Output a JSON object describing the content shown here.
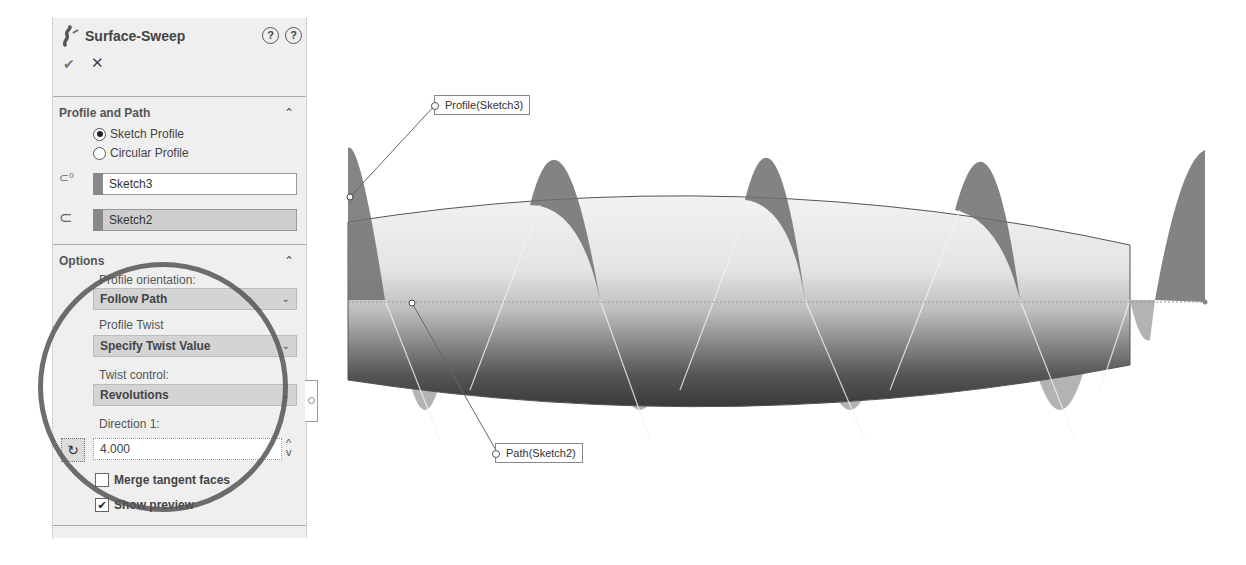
{
  "panel": {
    "title": "Surface-Sweep",
    "icons": {
      "feature": "sweep-feature-icon",
      "help_detail": "?",
      "help": "?",
      "ok": "✔",
      "cancel": "✕"
    },
    "profile_and_path": {
      "title": "Profile and Path",
      "collapse": "⌃",
      "radios": [
        {
          "label": "Sketch Profile",
          "checked": true
        },
        {
          "label": "Circular Profile",
          "checked": false
        }
      ],
      "profile_selection": "Sketch3",
      "path_selection": "Sketch2"
    },
    "options": {
      "title": "Options",
      "collapse": "⌃",
      "profile_orientation_label": "Profile orientation:",
      "profile_orientation_value": "Follow Path",
      "profile_twist_label": "Profile Twist",
      "profile_twist_value": "Specify Twist Value",
      "twist_control_label": "Twist control:",
      "twist_control_value": "Revolutions",
      "direction1_label": "Direction 1:",
      "direction1_value": "4.000",
      "merge_tangent_faces": {
        "label": "Merge tangent faces",
        "checked": false
      },
      "show_preview": {
        "label": "Show preview",
        "checked": true
      }
    }
  },
  "viewport": {
    "callouts": [
      {
        "label": "Profile(Sketch3)"
      },
      {
        "label": "Path(Sketch2)"
      }
    ],
    "colors": {
      "surface_light": "#e6e6e6",
      "surface_dark": "#3a3a3a",
      "sweep_fin": "#6e6e6e"
    }
  }
}
